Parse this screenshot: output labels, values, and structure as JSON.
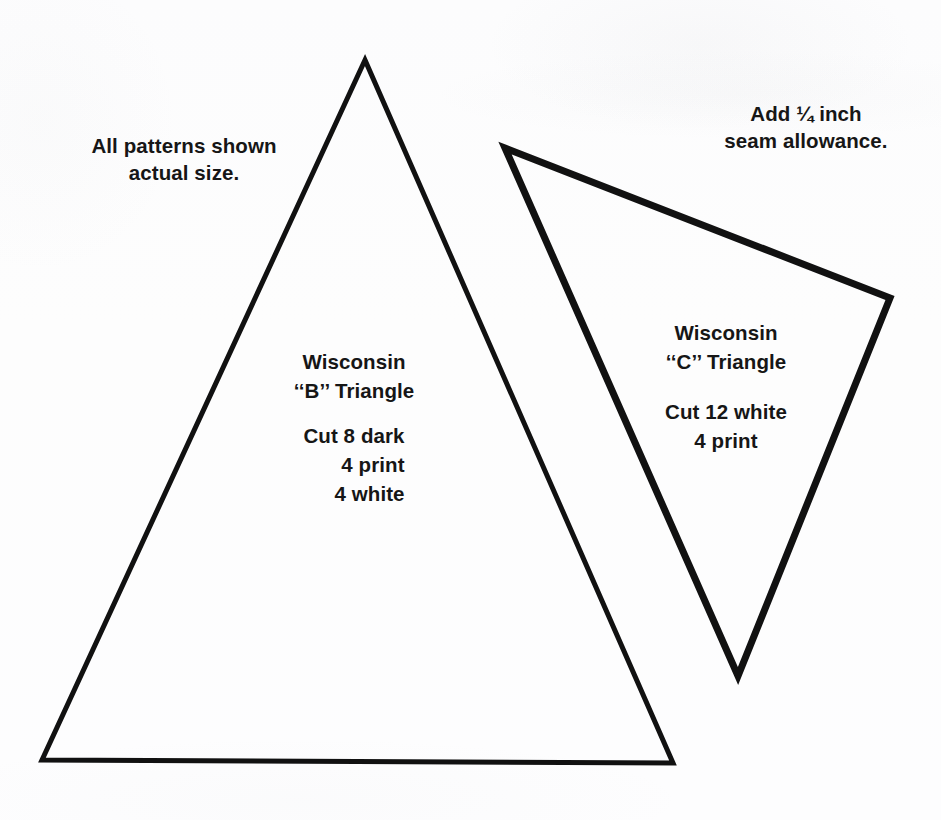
{
  "sheet": {
    "background_color": "#fdfdfd",
    "ink_color": "#161616",
    "width": 941,
    "height": 820
  },
  "notes": {
    "actual_size": "All patterns shown\nactual size.",
    "seam_allowance": "Add ¼ inch\nseam allowance."
  },
  "patterns": [
    {
      "id": "wisconsin-b",
      "name_line_1": "Wisconsin",
      "name_line_2": "‘‘B’’ Triangle",
      "cut_lines": [
        "Cut 8 dark",
        "4 print",
        "4 white"
      ],
      "shape": "triangle",
      "stroke_width": 5,
      "stroke_color": "#111111",
      "fill": "none",
      "points": [
        [
          365,
          60
        ],
        [
          673,
          763
        ],
        [
          42,
          760
        ]
      ]
    },
    {
      "id": "wisconsin-c",
      "name_line_1": "Wisconsin",
      "name_line_2": "‘‘C’’ Triangle",
      "cut_lines": [
        "Cut 12 white",
        "4 print"
      ],
      "shape": "triangle",
      "stroke_width": 7,
      "stroke_color": "#111111",
      "fill": "none",
      "points": [
        [
          505,
          148
        ],
        [
          890,
          298
        ],
        [
          738,
          676
        ]
      ]
    }
  ]
}
